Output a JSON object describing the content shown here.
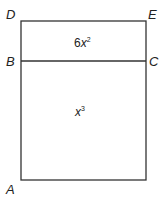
{
  "diagram": {
    "points": {
      "D": "D",
      "E": "E",
      "B": "B",
      "C": "C",
      "A": "A"
    },
    "regions": {
      "top": {
        "coefficient": "6",
        "variable": "x",
        "exponent": "2"
      },
      "bottom": {
        "variable": "x",
        "exponent": "3"
      }
    },
    "colors": {
      "stroke": "#333333",
      "background": "#ffffff"
    }
  }
}
